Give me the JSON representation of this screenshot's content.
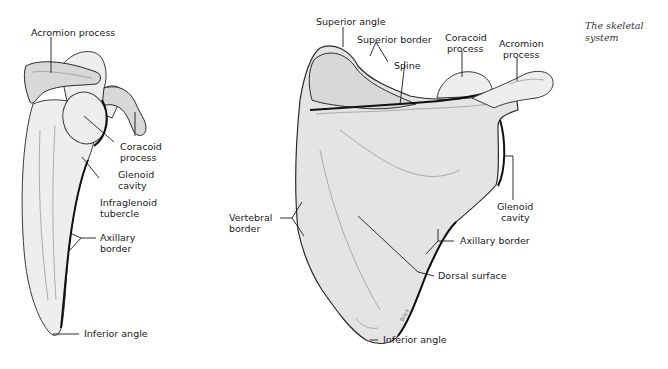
{
  "page": {
    "section_title_line1": "The skeletal",
    "section_title_line2": "system"
  },
  "lateral_view": {
    "labels": {
      "acromion_process": "Acromion process",
      "coracoid_process_line1": "Coracoid",
      "coracoid_process_line2": "process",
      "glenoid_cavity_line1": "Glenoid",
      "glenoid_cavity_line2": "cavity",
      "infraglenoid_tubercle_line1": "Infraglenoid",
      "infraglenoid_tubercle_line2": "tubercle",
      "axillary_border_line1": "Axillary",
      "axillary_border_line2": "border",
      "inferior_angle": "Inferior angle"
    }
  },
  "posterior_view": {
    "labels": {
      "superior_angle": "Superior angle",
      "superior_border": "Superior border",
      "spine": "Spine",
      "coracoid_process_line1": "Coracoid",
      "coracoid_process_line2": "process",
      "acromion_process_line1": "Acromion",
      "acromion_process_line2": "process",
      "glenoid_cavity_line1": "Glenoid",
      "glenoid_cavity_line2": "cavity",
      "vertebral_border_line1": "Vertebral",
      "vertebral_border_line2": "border",
      "axillary_border": "Axillary border",
      "dorsal_surface": "Dorsal surface",
      "inferior_angle": "Inferior angle",
      "artist_signature": "Brick"
    }
  }
}
